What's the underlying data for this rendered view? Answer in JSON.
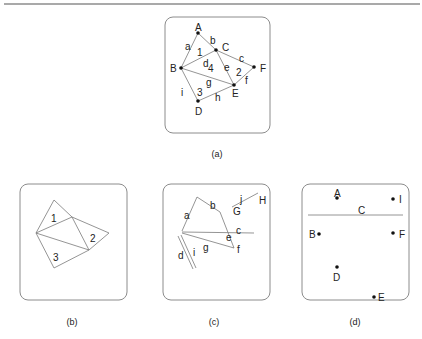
{
  "figure": {
    "width": 422,
    "height": 339,
    "top_rule": {
      "x1": 4,
      "y1": 4,
      "x2": 420,
      "y2": 4
    },
    "colors": {
      "frame": "#8c8c8c",
      "edge": "#7a7a7a",
      "point": "#111111",
      "text": "#222222"
    }
  },
  "panels": {
    "a": {
      "caption": "(a)",
      "caption_pos": {
        "x": 217,
        "y": 157
      },
      "frame": {
        "x": 165,
        "y": 17,
        "w": 105,
        "h": 116,
        "r": 8
      },
      "points": [
        {
          "name": "A",
          "x": 198,
          "y": 33,
          "lx": 195,
          "ly": 31
        },
        {
          "name": "B",
          "x": 181,
          "y": 68,
          "lx": 170,
          "ly": 72
        },
        {
          "name": "C",
          "x": 216,
          "y": 50,
          "lx": 222,
          "ly": 51
        },
        {
          "name": "D",
          "x": 198,
          "y": 101,
          "lx": 195,
          "ly": 115
        },
        {
          "name": "E",
          "x": 234,
          "y": 85,
          "lx": 232,
          "ly": 97
        },
        {
          "name": "F",
          "x": 254,
          "y": 67,
          "lx": 260,
          "ly": 72
        }
      ],
      "edges": [
        {
          "label": "a",
          "from": "B",
          "to": "A",
          "lx": 185,
          "ly": 50
        },
        {
          "label": "b",
          "from": "A",
          "to": "C",
          "lx": 210,
          "ly": 44
        },
        {
          "label": "c",
          "from": "C",
          "to": "F",
          "lx": 239,
          "ly": 62
        },
        {
          "label": "d",
          "from": "B",
          "to": "C",
          "lx": 203,
          "ly": 67
        },
        {
          "label": "e",
          "from": "C",
          "to": "E",
          "lx": 224,
          "ly": 71
        },
        {
          "label": "f",
          "from": "E",
          "to": "F",
          "lx": 245,
          "ly": 84
        },
        {
          "label": "g",
          "from": "B",
          "to": "E",
          "lx": 206,
          "ly": 86
        },
        {
          "label": "h",
          "from": "D",
          "to": "E",
          "lx": 215,
          "ly": 101
        },
        {
          "label": "i",
          "from": "B",
          "to": "D",
          "lx": 181,
          "ly": 96
        }
      ],
      "faces": [
        {
          "label": "1",
          "x": 197,
          "y": 56
        },
        {
          "label": "2",
          "x": 236,
          "y": 76
        },
        {
          "label": "3",
          "x": 197,
          "y": 96
        },
        {
          "label": "4",
          "x": 208,
          "y": 72
        }
      ]
    },
    "b": {
      "caption": "(b)",
      "caption_pos": {
        "x": 72,
        "y": 325
      },
      "frame": {
        "x": 20,
        "y": 184,
        "w": 107,
        "h": 116,
        "r": 8
      },
      "points": [
        {
          "name": "A",
          "x": 54,
          "y": 200
        },
        {
          "name": "B",
          "x": 36,
          "y": 233
        },
        {
          "name": "C",
          "x": 72,
          "y": 217
        },
        {
          "name": "D",
          "x": 54,
          "y": 268
        },
        {
          "name": "E",
          "x": 89,
          "y": 250
        },
        {
          "name": "F",
          "x": 109,
          "y": 233
        }
      ],
      "edges": [
        {
          "from": "B",
          "to": "A"
        },
        {
          "from": "A",
          "to": "C"
        },
        {
          "from": "C",
          "to": "F"
        },
        {
          "from": "B",
          "to": "C"
        },
        {
          "from": "C",
          "to": "E"
        },
        {
          "from": "E",
          "to": "F"
        },
        {
          "from": "B",
          "to": "E"
        },
        {
          "from": "D",
          "to": "E"
        },
        {
          "from": "B",
          "to": "D"
        }
      ],
      "faces": [
        {
          "label": "1",
          "x": 51,
          "y": 222
        },
        {
          "label": "2",
          "x": 90,
          "y": 242
        },
        {
          "label": "3",
          "x": 53,
          "y": 261
        }
      ]
    },
    "c": {
      "caption": "(c)",
      "caption_pos": {
        "x": 214,
        "y": 325
      },
      "frame": {
        "x": 163,
        "y": 184,
        "w": 107,
        "h": 116,
        "r": 8
      },
      "segments": [
        {
          "label": "a",
          "x1": 182,
          "y1": 231,
          "x2": 197,
          "y2": 197,
          "lx": 184,
          "ly": 219
        },
        {
          "label": "b",
          "x1": 197,
          "y1": 197,
          "x2": 220,
          "y2": 212,
          "lx": 210,
          "ly": 209
        },
        {
          "label": "e",
          "x1": 220,
          "y1": 212,
          "x2": 234,
          "y2": 248,
          "lx": 226,
          "ly": 241
        },
        {
          "label": "c",
          "x1": 182,
          "y1": 232,
          "x2": 254,
          "y2": 233,
          "lx": 236,
          "ly": 234
        },
        {
          "label": "g",
          "x1": 182,
          "y1": 233,
          "x2": 234,
          "y2": 248,
          "lx": 203,
          "ly": 251
        },
        {
          "label": "j",
          "x1": 232,
          "y1": 207,
          "x2": 258,
          "y2": 193,
          "lx": 240,
          "ly": 203
        },
        {
          "label": "d",
          "x1": 178,
          "y1": 236,
          "x2": 193,
          "y2": 269,
          "lx": 178,
          "ly": 259
        },
        {
          "label": "i",
          "x1": 181,
          "y1": 235,
          "x2": 196,
          "y2": 268,
          "lx": 193,
          "ly": 256
        }
      ],
      "labels": [
        {
          "text": "f",
          "x": 237,
          "y": 253
        },
        {
          "text": "G",
          "x": 233,
          "y": 215
        },
        {
          "text": "H",
          "x": 259,
          "y": 204
        }
      ]
    },
    "d": {
      "caption": "(d)",
      "caption_pos": {
        "x": 355,
        "y": 325
      },
      "frame": {
        "x": 302,
        "y": 184,
        "w": 107,
        "h": 116,
        "r": 8
      },
      "rule": {
        "label": "C",
        "x1": 308,
        "y1": 215,
        "x2": 403,
        "y2": 215,
        "lx": 358,
        "ly": 215
      },
      "points": [
        {
          "name": "A",
          "x": 337,
          "y": 198,
          "lx": 334,
          "ly": 197
        },
        {
          "name": "I",
          "x": 393,
          "y": 199,
          "lx": 399,
          "ly": 203
        },
        {
          "name": "B",
          "x": 319,
          "y": 234,
          "lx": 309,
          "ly": 238
        },
        {
          "name": "F",
          "x": 393,
          "y": 233,
          "lx": 399,
          "ly": 238
        },
        {
          "name": "D",
          "x": 337,
          "y": 267,
          "lx": 333,
          "ly": 281
        },
        {
          "name": "E",
          "x": 374,
          "y": 297,
          "lx": 378,
          "ly": 301
        }
      ]
    }
  }
}
